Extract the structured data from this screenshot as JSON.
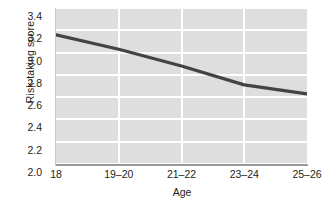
{
  "chart_data": {
    "type": "line",
    "title": "",
    "xlabel": "Age",
    "ylabel": "Risk-taking score",
    "categories": [
      "18",
      "19–20",
      "21–22",
      "23–24",
      "25–26"
    ],
    "values": [
      3.16,
      3.03,
      2.88,
      2.71,
      2.63
    ],
    "series": [
      {
        "name": "Risk-taking score",
        "values": [
          3.16,
          3.03,
          2.88,
          2.71,
          2.63
        ],
        "color": "#434343"
      }
    ],
    "ylim": [
      2.0,
      3.4
    ],
    "xlim": [
      0,
      4
    ],
    "yticks": [
      "3.4",
      "3.2",
      "3.0",
      "2.8",
      "2.6",
      "2.4",
      "2.2",
      "2.0"
    ],
    "ytick_values": [
      3.4,
      3.2,
      3.0,
      2.8,
      2.6,
      2.4,
      2.2,
      2.0
    ],
    "xticks": [
      "18",
      "19–20",
      "21–22",
      "23–24",
      "25–26"
    ],
    "grid": "horizontal-and-vertical",
    "legend": "none",
    "panel_background": "#dedede",
    "gridline_color": "#ffffff",
    "line_color": "#434343",
    "axis_color": "#9a9a9a"
  }
}
